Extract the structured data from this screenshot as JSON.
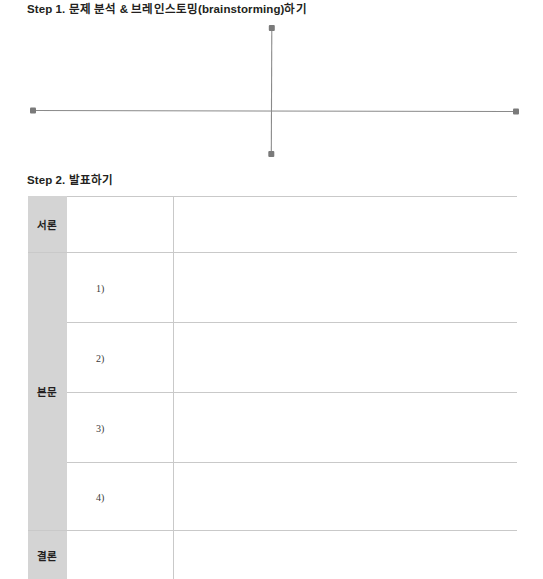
{
  "page": {
    "background": "#ffffff",
    "width": 543,
    "height": 579
  },
  "steps": [
    {
      "id": "step1",
      "label": "Step 1.",
      "title": "문제 분석 & 브레인스토밍(brainstorming)하기",
      "full_title": "Step 1. 문제 분석 & 브레인스토밍(brainstorming)하기"
    },
    {
      "id": "step2",
      "label": "Step 2.",
      "title": "발표하기",
      "full_title": "Step 2. 발표하기"
    }
  ],
  "diagram": {
    "type": "crosshair-axes",
    "line_color": "#8a8a8a",
    "dot_color": "#7a7a7a",
    "center": {
      "x": 271.5,
      "y": 92.5
    },
    "endpoints": [
      {
        "name": "top-endpoint",
        "x": 272,
        "y": 28
      },
      {
        "name": "right-endpoint",
        "x": 516,
        "y": 93
      },
      {
        "name": "bottom-endpoint",
        "x": 271,
        "y": 154
      },
      {
        "name": "left-endpoint",
        "x": 33,
        "y": 92
      }
    ]
  },
  "table": {
    "border_color": "#c9c9c9",
    "label_cell_background": "#d4d4d4",
    "columns": [
      "section",
      "item-number",
      "content"
    ],
    "rows": [
      {
        "section_label": "서론",
        "section_rowspan": 1,
        "items": [
          {
            "number": "",
            "content": ""
          }
        ]
      },
      {
        "section_label": "본문",
        "section_rowspan": 4,
        "items": [
          {
            "number": "1)",
            "content": ""
          },
          {
            "number": "2)",
            "content": ""
          },
          {
            "number": "3)",
            "content": ""
          },
          {
            "number": "4)",
            "content": ""
          }
        ]
      },
      {
        "section_label": "결론",
        "section_rowspan": 1,
        "items": [
          {
            "number": "",
            "content": ""
          }
        ]
      }
    ]
  }
}
